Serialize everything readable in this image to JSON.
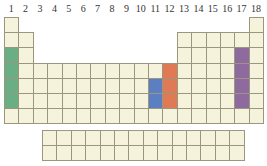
{
  "group_labels": [
    "1",
    "2",
    "3",
    "4",
    "5",
    "6",
    "7",
    "8",
    "9",
    "10",
    "11",
    "12",
    "13",
    "14",
    "15",
    "16",
    "17",
    "18"
  ],
  "colors": {
    "cell_fill": "#f6f3dd",
    "grid_line": "#9a9680",
    "label_text": "#333333",
    "highlight_green": "#6aae84",
    "highlight_blue": "#5b7fc0",
    "highlight_orange": "#e07a55",
    "highlight_purple": "#8e6a9e"
  },
  "highlights": [
    {
      "group": 1,
      "periods": [
        3,
        4,
        5,
        6
      ],
      "color": "#6aae84"
    },
    {
      "group": 11,
      "periods": [
        5,
        6
      ],
      "color": "#5b7fc0"
    },
    {
      "group": 12,
      "periods": [
        4,
        5,
        6
      ],
      "color": "#e07a55"
    },
    {
      "group": 17,
      "periods": [
        3,
        4,
        5,
        6
      ],
      "color": "#8e6a9e"
    }
  ],
  "layout": {
    "periods": 7,
    "f_block_rows": 2,
    "f_block_columns": 14
  }
}
